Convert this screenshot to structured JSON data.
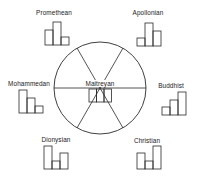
{
  "diagram": {
    "center": {
      "label": "Maitreyan",
      "bars": [
        1,
        1,
        1
      ]
    },
    "types": [
      {
        "id": "promethean",
        "label": "Promethean",
        "bars": [
          0.65,
          1.0,
          0.35
        ]
      },
      {
        "id": "apollonian",
        "label": "Apollonian",
        "bars": [
          0.35,
          1.0,
          0.65
        ]
      },
      {
        "id": "mohammedan",
        "label": "Mohammedan",
        "bars": [
          1.0,
          0.65,
          0.35
        ]
      },
      {
        "id": "buddhist",
        "label": "Buddhist",
        "bars": [
          0.35,
          0.65,
          1.0
        ]
      },
      {
        "id": "dionysian",
        "label": "Dionysian",
        "bars": [
          1.0,
          0.35,
          0.65
        ]
      },
      {
        "id": "christian",
        "label": "Christian",
        "bars": [
          0.65,
          0.35,
          1.0
        ]
      }
    ]
  },
  "colors": {
    "stroke": "#2a2a2a",
    "background": "#ffffff"
  }
}
